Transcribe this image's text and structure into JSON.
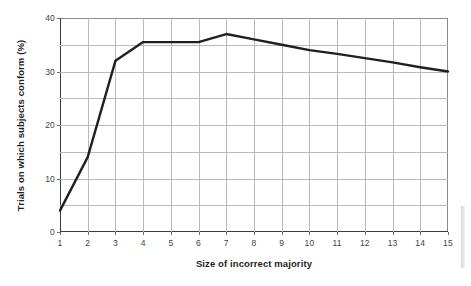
{
  "chart_data": {
    "type": "line",
    "title": "",
    "xlabel": "Size of incorrect majority",
    "ylabel": "Trials on which subjects conform (%)",
    "x": [
      1,
      2,
      3,
      4,
      5,
      6,
      7,
      8,
      9,
      10,
      11,
      12,
      13,
      14,
      15
    ],
    "values": [
      4,
      14,
      32,
      35.5,
      35.5,
      35.5,
      37,
      36,
      35,
      34,
      33.3,
      32.5,
      31.7,
      30.8,
      30
    ],
    "series": [
      {
        "name": "Trials on which subjects conform (%)",
        "values": [
          4,
          14,
          32,
          35.5,
          35.5,
          35.5,
          37,
          36,
          35,
          34,
          33.3,
          32.5,
          31.7,
          30.8,
          30
        ]
      }
    ],
    "xlim": [
      1,
      15
    ],
    "ylim": [
      0,
      40
    ],
    "xticks": [
      "1",
      "2",
      "3",
      "4",
      "5",
      "6",
      "7",
      "8",
      "9",
      "10",
      "11",
      "12",
      "13",
      "14",
      "15"
    ],
    "yticks": [
      "0",
      "10",
      "20",
      "30",
      "40"
    ],
    "y_gridline_values": [
      0,
      5,
      10,
      15,
      20,
      25,
      30,
      35,
      40
    ],
    "grid": true,
    "legend": "none",
    "line_color": "#231f20"
  },
  "colors": {
    "line": "#231f20",
    "grid": "#b9b9b9",
    "axis": "#3b3b3b",
    "background": "#ffffff",
    "text": "#231f20"
  }
}
